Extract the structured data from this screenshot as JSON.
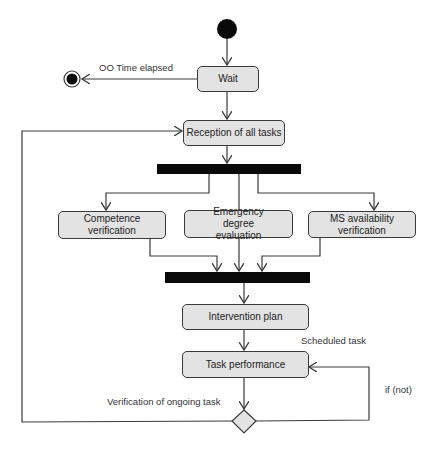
{
  "diagram": {
    "type": "UML activity diagram",
    "colors": {
      "node_fill": "#e3e3e3",
      "stroke": "#3a3a3a",
      "bar": "#0a0a0a",
      "text": "#222222"
    },
    "nodes": {
      "wait": "Wait",
      "reception": "Reception of all tasks",
      "competence": "Competence verification",
      "emergency": "Emergency degree evaluation",
      "ms_availability": "MS availability verification",
      "intervention": "Intervention plan",
      "task_performance": "Task performance"
    },
    "labels": {
      "time_elapsed": "OO Time elapsed",
      "scheduled_task": "Scheduled task",
      "verification_ongoing": "Verification of ongoing task",
      "if_not": "if (not)"
    },
    "control_nodes": [
      "initial-node",
      "final-node",
      "fork-bar",
      "join-bar",
      "decision-diamond"
    ]
  }
}
